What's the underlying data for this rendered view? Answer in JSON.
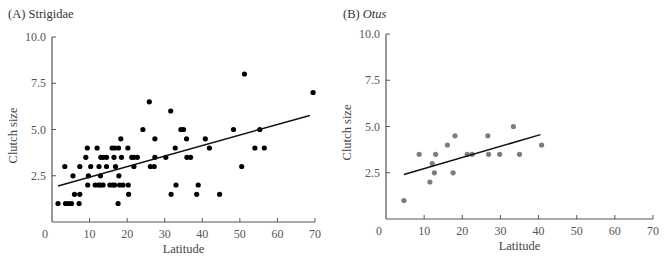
{
  "colors": {
    "axis": "#555555",
    "line": "#111111",
    "points_a": "#000000",
    "points_b": "#7d7d7d"
  },
  "chart_data": [
    {
      "type": "scatter",
      "title": "(A) Strigidae",
      "title_prefix": "(A)",
      "title_name": "Strigidae",
      "title_italic": false,
      "xlabel": "Latitude",
      "ylabel": "Clutch size",
      "xlim": [
        0,
        70
      ],
      "ylim": [
        0,
        10
      ],
      "xticks": [
        0,
        10,
        20,
        30,
        40,
        50,
        60,
        70
      ],
      "xtick_labels": [
        "0",
        "10",
        "20",
        "30",
        "40",
        "50",
        "60",
        "70"
      ],
      "yticks": [
        2.5,
        5.0,
        7.5,
        10.0
      ],
      "ytick_labels": [
        "2.5",
        "5.0",
        "7.5",
        "10.0"
      ],
      "grid": false,
      "legend": null,
      "trendline": {
        "x": [
          1.6,
          68.6
        ],
        "y": [
          1.95,
          5.76
        ]
      },
      "points": [
        [
          1.6,
          1.0
        ],
        [
          3.4,
          3.0
        ],
        [
          3.6,
          1.0
        ],
        [
          4.4,
          1.0
        ],
        [
          5.2,
          1.0
        ],
        [
          5.6,
          2.5
        ],
        [
          6.0,
          1.5
        ],
        [
          7.4,
          1.5
        ],
        [
          7.4,
          3.0
        ],
        [
          7.2,
          1.0
        ],
        [
          9.0,
          3.5
        ],
        [
          9.4,
          4.0
        ],
        [
          9.7,
          2.5
        ],
        [
          9.5,
          2.0
        ],
        [
          10.3,
          3.0
        ],
        [
          11.5,
          2.0
        ],
        [
          12.0,
          4.0
        ],
        [
          12.4,
          2.0
        ],
        [
          12.5,
          3.0
        ],
        [
          12.9,
          2.5
        ],
        [
          12.9,
          2.0
        ],
        [
          13.0,
          3.5
        ],
        [
          13.6,
          3.5
        ],
        [
          13.6,
          2.0
        ],
        [
          14.5,
          3.5
        ],
        [
          14.5,
          3.0
        ],
        [
          15.4,
          2.0
        ],
        [
          16.0,
          4.0
        ],
        [
          16.2,
          2.0
        ],
        [
          16.5,
          3.5
        ],
        [
          16.7,
          4.0
        ],
        [
          16.7,
          2.0
        ],
        [
          16.9,
          3.0
        ],
        [
          17.6,
          1.0
        ],
        [
          17.7,
          4.0
        ],
        [
          17.8,
          2.5
        ],
        [
          18.0,
          2.0
        ],
        [
          18.3,
          4.5
        ],
        [
          18.5,
          3.5
        ],
        [
          18.9,
          2.0
        ],
        [
          20.2,
          4.0
        ],
        [
          20.3,
          2.0
        ],
        [
          20.4,
          1.5
        ],
        [
          21.2,
          3.5
        ],
        [
          21.8,
          3.5
        ],
        [
          21.8,
          3.0
        ],
        [
          22.7,
          3.5
        ],
        [
          24.2,
          5.0
        ],
        [
          25.9,
          6.5
        ],
        [
          26.2,
          3.0
        ],
        [
          27.2,
          3.0
        ],
        [
          27.4,
          3.5
        ],
        [
          27.4,
          4.5
        ],
        [
          30.3,
          3.5
        ],
        [
          31.6,
          6.0
        ],
        [
          31.7,
          1.5
        ],
        [
          32.8,
          4.0
        ],
        [
          33.0,
          2.0
        ],
        [
          34.3,
          5.0
        ],
        [
          35.0,
          5.0
        ],
        [
          35.8,
          4.5
        ],
        [
          35.9,
          3.5
        ],
        [
          36.9,
          3.5
        ],
        [
          38.5,
          1.5
        ],
        [
          38.9,
          2.0
        ],
        [
          40.8,
          4.5
        ],
        [
          41.9,
          4.0
        ],
        [
          44.6,
          1.5
        ],
        [
          48.3,
          5.0
        ],
        [
          50.5,
          3.0
        ],
        [
          51.2,
          8.0
        ],
        [
          54.0,
          4.0
        ],
        [
          55.3,
          5.0
        ],
        [
          56.5,
          4.0
        ],
        [
          69.5,
          7.0
        ]
      ],
      "layout": {
        "x0": 52,
        "x70": 315,
        "y0": 222,
        "y10": 37,
        "title_x": 8,
        "title_y": 18
      }
    },
    {
      "type": "scatter",
      "title": "(B) Otus",
      "title_prefix": "(B)",
      "title_name": "Otus",
      "title_italic": true,
      "xlabel": "Latitude",
      "ylabel": "Clutch size",
      "xlim": [
        0,
        70
      ],
      "ylim": [
        0,
        10
      ],
      "xticks": [
        0,
        10,
        20,
        30,
        40,
        50,
        60,
        70
      ],
      "xtick_labels": [
        "0",
        "10",
        "20",
        "30",
        "40",
        "50",
        "60",
        "70"
      ],
      "yticks": [
        2.5,
        5.0,
        7.5,
        10.0
      ],
      "ytick_labels": [
        "2.5",
        "5.0",
        "7.5",
        "10.0"
      ],
      "grid": false,
      "legend": null,
      "trendline": {
        "x": [
          4.7,
          40.5
        ],
        "y": [
          2.41,
          4.56
        ]
      },
      "points": [
        [
          4.7,
          1.0
        ],
        [
          8.7,
          3.5
        ],
        [
          11.5,
          2.0
        ],
        [
          12.1,
          3.0
        ],
        [
          12.7,
          2.5
        ],
        [
          13.0,
          3.5
        ],
        [
          16.1,
          4.0
        ],
        [
          17.6,
          2.5
        ],
        [
          18.1,
          4.5
        ],
        [
          21.3,
          3.5
        ],
        [
          22.6,
          3.5
        ],
        [
          26.7,
          4.5
        ],
        [
          26.9,
          3.5
        ],
        [
          29.8,
          3.5
        ],
        [
          33.4,
          5.0
        ],
        [
          35.0,
          3.5
        ],
        [
          40.8,
          4.0
        ]
      ],
      "layout": {
        "x0": 53,
        "x70": 320,
        "y0": 219,
        "y10": 34,
        "title_x": 10,
        "title_y": 18
      }
    }
  ]
}
